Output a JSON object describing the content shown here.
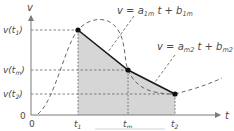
{
  "diagram": {
    "axes": {
      "x_label": "t",
      "y_label": "v",
      "origin_x_label": "0",
      "origin_y_label": "0"
    },
    "y_ticks": [
      {
        "label_main": "v(t",
        "label_sub": "1",
        "label_close": ")"
      },
      {
        "label_main": "v(t",
        "label_sub": "m",
        "label_close": ")"
      },
      {
        "label_main": "v(t",
        "label_sub": "2",
        "label_close": ")"
      }
    ],
    "x_ticks": [
      {
        "label_main": "t",
        "label_sub": "1"
      },
      {
        "label_main": "t",
        "label_sub": "m"
      },
      {
        "label_main": "t",
        "label_sub": "2"
      }
    ],
    "equations": [
      {
        "lhs": "v = a",
        "sub1": "1m",
        "mid": " t + b",
        "sub2": "1m"
      },
      {
        "lhs": "v = a",
        "sub1": "m2",
        "mid": " t + b",
        "sub2": "m2"
      }
    ],
    "caption": "",
    "colors": {
      "axis": "#7a7a7a",
      "line": "#1a1a1a",
      "fill": "#d6d6d6",
      "dash": "#555555",
      "text": "#4a4a4a"
    }
  }
}
